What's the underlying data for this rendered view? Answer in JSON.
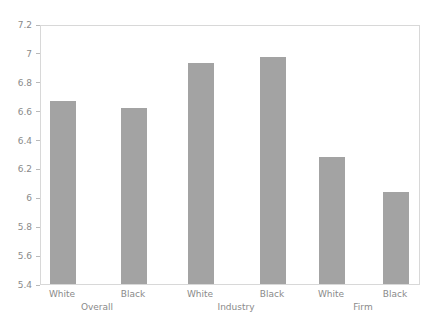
{
  "chart_data": {
    "type": "bar",
    "title": "",
    "xlabel": "",
    "ylabel": "",
    "ylim": [
      5.4,
      7.2
    ],
    "grid": false,
    "legend": null,
    "bar_color": "#a3a3a3",
    "axis_color": "#d8d8d8",
    "tick_label_color": "#8a8a8a",
    "yticks": [
      5.4,
      5.6,
      5.8,
      6,
      6.2,
      6.4,
      6.6,
      6.8,
      7,
      7.2
    ],
    "ytick_labels": [
      "5.4",
      "5.6",
      "5.8",
      "6",
      "6.2",
      "6.4",
      "6.6",
      "6.8",
      "7",
      "7.2"
    ],
    "categories": [
      "White",
      "Black",
      "White",
      "Black",
      "White",
      "Black"
    ],
    "groups": [
      "Overall",
      "Industry",
      "Firm"
    ],
    "values": [
      6.67,
      6.62,
      6.93,
      6.97,
      6.28,
      6.04
    ],
    "bars": [
      {
        "label": "White",
        "group": "Overall",
        "value": 6.67
      },
      {
        "label": "Black",
        "group": "Overall",
        "value": 6.62
      },
      {
        "label": "White",
        "group": "Industry",
        "value": 6.93
      },
      {
        "label": "Black",
        "group": "Industry",
        "value": 6.97
      },
      {
        "label": "White",
        "group": "Firm",
        "value": 6.28
      },
      {
        "label": "Black",
        "group": "Firm",
        "value": 6.04
      }
    ]
  }
}
